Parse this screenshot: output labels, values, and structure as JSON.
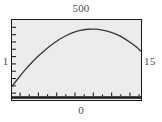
{
  "figure": {
    "kind": "plot",
    "background_color": "#ffffff",
    "plot_background_color": "#ececec",
    "frame_color": "#1a1a1a",
    "curve_color": "#3a3a3a"
  },
  "labels": {
    "top": "500",
    "bottom": "0",
    "left": "1",
    "right": "15"
  },
  "chart_data": {
    "type": "line",
    "title": "",
    "subtitle": "",
    "xlabel": "",
    "ylabel": "",
    "top_label": "500",
    "bottom_label": "0",
    "left_label": "1",
    "right_label": "15",
    "xlim": [
      1,
      15
    ],
    "ylim": [
      0,
      500
    ],
    "grid": false,
    "legend": false,
    "legend_position": "none",
    "xticks": [
      1,
      2,
      3,
      4,
      5,
      6,
      7,
      8,
      9,
      10,
      11,
      12,
      13,
      14,
      15
    ],
    "yticks": [
      0,
      50,
      100,
      150,
      200,
      250,
      300,
      350,
      400,
      450,
      500
    ],
    "xtick_labels": [],
    "ytick_labels": [],
    "annotations": [],
    "series": [
      {
        "name": "curve",
        "color": "#3a3a3a",
        "x": [
          1.0,
          1.7,
          2.4,
          3.1,
          3.8,
          4.5,
          5.2,
          6.0,
          6.8,
          7.6,
          8.4,
          9.2,
          10.0,
          10.8,
          11.6,
          12.4,
          13.2,
          14.0,
          14.6,
          15.0
        ],
        "y": [
          75,
          130,
          182,
          230,
          273,
          312,
          347,
          382,
          410,
          432,
          447,
          455,
          456,
          450,
          438,
          419,
          393,
          360,
          331,
          308
        ]
      }
    ]
  }
}
